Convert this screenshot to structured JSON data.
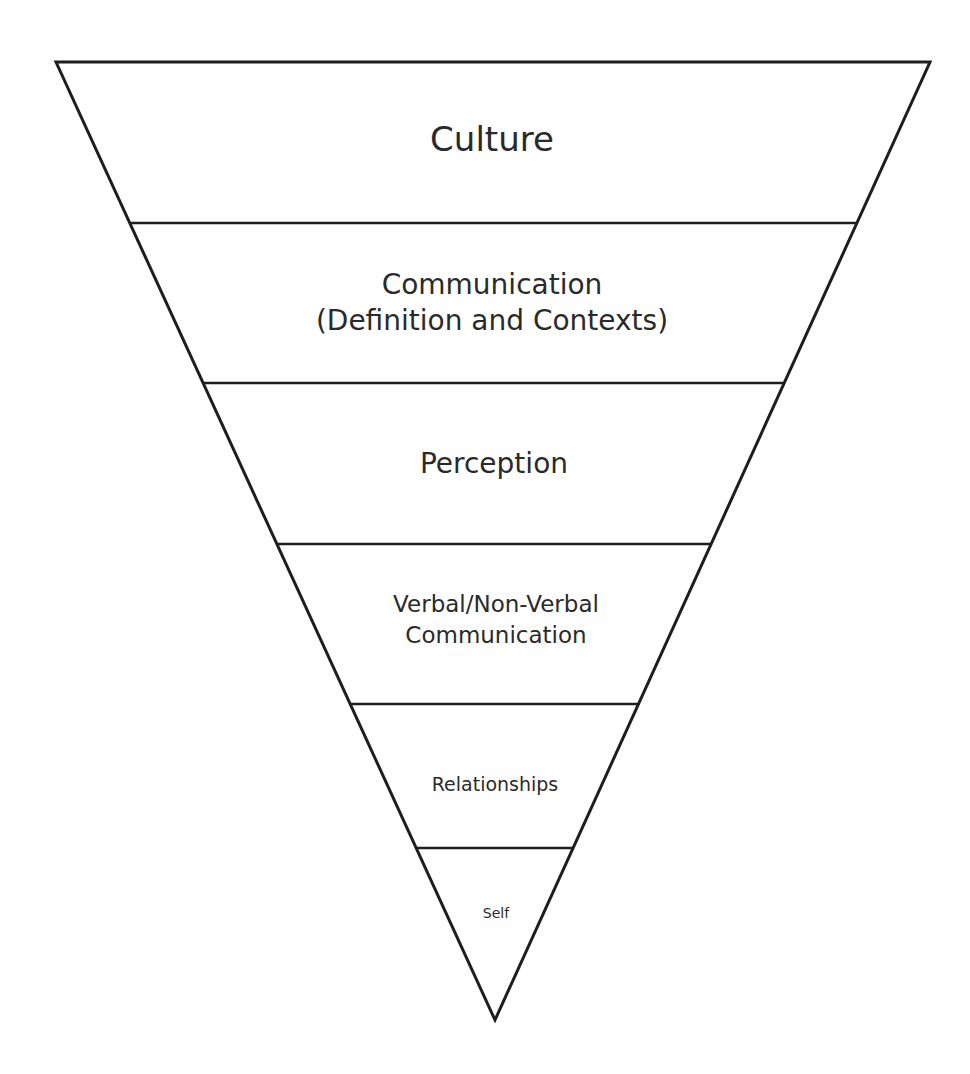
{
  "diagram": {
    "type": "inverted-pyramid",
    "layers": [
      {
        "label_lines": [
          "Culture"
        ]
      },
      {
        "label_lines": [
          "Communication",
          "(Definition and Contexts)"
        ]
      },
      {
        "label_lines": [
          "Perception"
        ]
      },
      {
        "label_lines": [
          "Verbal/Non-Verbal",
          "Communication"
        ]
      },
      {
        "label_lines": [
          "Relationships"
        ]
      },
      {
        "label_lines": [
          "Self"
        ]
      }
    ]
  }
}
